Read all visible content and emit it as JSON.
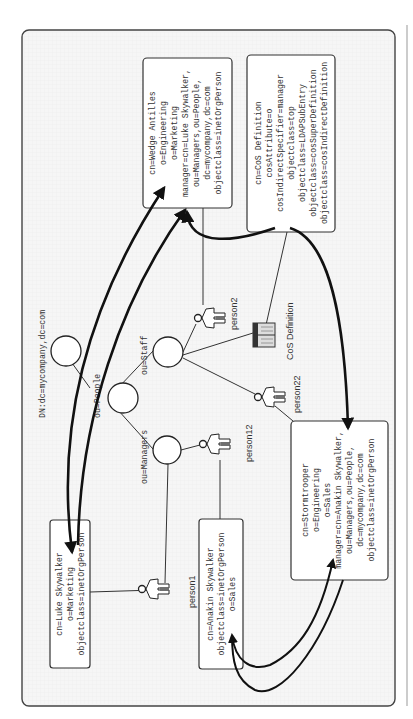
{
  "diagram": {
    "orientation": "rotated-90-ccw",
    "root_label": "DN:dc=mycompany,dc=com",
    "branches": {
      "people": "ou=People",
      "staff": "ou=Staff",
      "managers": "ou=Managers"
    },
    "persons": {
      "person1": "person1",
      "person2": "person2",
      "person12": "person12",
      "person22": "person22"
    },
    "cos_icon_label": "CoS Definition",
    "entries": {
      "wedge": {
        "lines": [
          "cn=Wedge Antilles",
          "o=Engineering",
          "o=Marketing",
          "manager=cn=Luke Skywalker,",
          "ou=Managers,ou=People,",
          "dc=mycompany,dc=com",
          "objectclass=inetOrgPerson"
        ]
      },
      "cos": {
        "lines": [
          "cn=CoS Definition",
          "cosAttribute=o",
          "cosIndirectSpecifier=manager",
          "objectclass=top",
          "objectclass=LDAPSubEntry",
          "objectclass=cosSuperDefinition",
          "objectclass=cosIndirectDefinition"
        ]
      },
      "luke": {
        "lines": [
          "cn=Luke Skywalker",
          "o=Marketing",
          "objectclass=inetOrgPerson"
        ]
      },
      "anakin": {
        "lines": [
          "cn=Anakin Skywalker",
          "objectclass=inetOrgPerson",
          "o=Sales"
        ]
      },
      "stormtrooper": {
        "lines": [
          "cn=Stormtrooper",
          "o=Engineering",
          "o=Sales",
          "manager=cn=Anakin Skywalker,",
          "ou=Managers,ou=People,",
          "dc=mycompany,dc=com",
          "objectclass=inetOrgPerson"
        ]
      }
    },
    "colors": {
      "frame_bg": "#f4f4f4",
      "stroke": "#333333",
      "arrow": "#111111",
      "box_bg": "#ffffff"
    }
  }
}
